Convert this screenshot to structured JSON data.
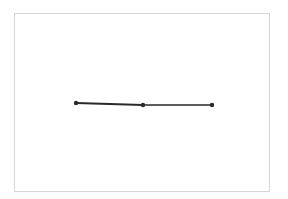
{
  "diagram": {
    "type": "line-segment-sketch",
    "frame": {
      "x": 14,
      "y": 13,
      "width": 256,
      "height": 179,
      "color": "#d6d6d6"
    },
    "stroke_color": "#2a2a2a",
    "points": [
      {
        "id": "left",
        "x": 76,
        "y": 103
      },
      {
        "id": "middle",
        "x": 143,
        "y": 105
      },
      {
        "id": "right",
        "x": 212,
        "y": 105
      }
    ],
    "segments": [
      {
        "from": "left",
        "to": "middle",
        "width": 1.8
      },
      {
        "from": "middle",
        "to": "right",
        "width": 1.3
      }
    ]
  }
}
